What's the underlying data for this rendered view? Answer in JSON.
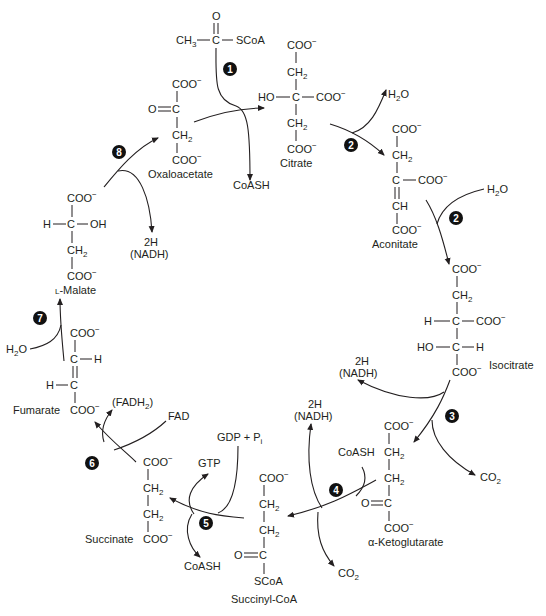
{
  "colors": {
    "ink": "#231f20",
    "badge": "#111111",
    "badge_text": "#ffffff",
    "background": "#ffffff"
  },
  "groups": {
    "coo": "COO",
    "charge": "−",
    "ch2": "CH",
    "two": "2",
    "ch": "CH",
    "c": "C",
    "o": "O",
    "h": "H",
    "ho": "HO",
    "oh": "OH",
    "ch3": "CH",
    "three": "3",
    "scoa": "SCoA"
  },
  "compounds": {
    "acetyl_coa": {
      "name": "Acetyl-CoA"
    },
    "oxaloacetate": {
      "name": "Oxaloacetate"
    },
    "citrate": {
      "name": "Citrate"
    },
    "aconitate": {
      "name": "Aconitate"
    },
    "isocitrate": {
      "name": "Isocitrate"
    },
    "alpha_ketoglutarate": {
      "name": "α-Ketoglutarate"
    },
    "succinyl_coa": {
      "name": "Succinyl-CoA"
    },
    "succinate": {
      "name": "Succinate"
    },
    "fumarate": {
      "name": "Fumarate"
    },
    "malate": {
      "name": "L-Malate",
      "prefix": "L",
      "rest": "-Malate"
    }
  },
  "cofactors": {
    "coash": "CoASH",
    "h2o_h": "H",
    "h2o_2": "2",
    "h2o_o": "O",
    "nadh_2h": "2H",
    "nadh": "(NADH)",
    "co2_c": "CO",
    "co2_2": "2",
    "gdp": "GDP + P",
    "gdp_i": "i",
    "gtp": "GTP",
    "fad": "FAD",
    "fadh2_open": "(FADH",
    "fadh2_2": "2",
    "fadh2_close": ")"
  },
  "steps": [
    {
      "n": "1"
    },
    {
      "n": "2"
    },
    {
      "n": "2"
    },
    {
      "n": "3"
    },
    {
      "n": "4"
    },
    {
      "n": "5"
    },
    {
      "n": "6"
    },
    {
      "n": "7"
    },
    {
      "n": "8"
    }
  ]
}
